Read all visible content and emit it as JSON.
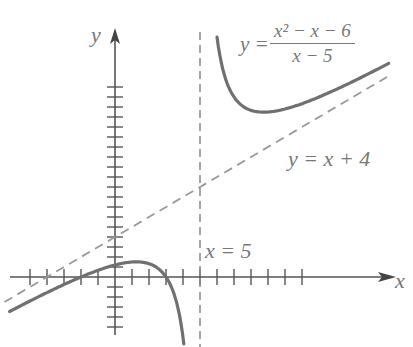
{
  "chart_data": {
    "type": "line",
    "title": "",
    "xlabel": "x",
    "ylabel": "y",
    "series": [
      {
        "name": "y = (x^2 - x - 6)/(x - 5)",
        "style": "solid",
        "color": "#707070",
        "branches": [
          {
            "x": [
              -7.5,
              -6,
              -4,
              -2,
              0,
              1,
              2,
              3,
              3.5,
              4,
              4.3
            ],
            "y": [
              -1.2,
              -0.5,
              0.7,
              0.0,
              1.2,
              1.0,
              0.0,
              0.0,
              -1.7,
              -6,
              -10
            ]
          },
          {
            "x": [
              6.1,
              6.5,
              7,
              8,
              9,
              10,
              11.5,
              13,
              16
            ],
            "y": [
              24.5,
              20,
              18,
              18.7,
              18.5,
              19.1,
              20.5,
              21.4,
              23.9
            ]
          }
        ]
      },
      {
        "name": "y = x + 4",
        "style": "dashed",
        "color": "#909090",
        "x": [
          -7.5,
          16
        ],
        "y": [
          -3.5,
          20
        ]
      },
      {
        "name": "x = 5",
        "style": "dashed",
        "color": "#808080",
        "x": [
          5,
          5
        ],
        "y": [
          -10,
          24
        ]
      }
    ],
    "annotations": [
      "y = (x^2 - x - 6)/(x - 5)",
      "y = x + 4",
      "x = 5"
    ],
    "x_ticks_count": 16,
    "y_ticks_count": 20,
    "grid": false,
    "legend": "none (inline labels)"
  },
  "labels": {
    "y_axis": "y",
    "x_axis": "x",
    "func_lhs": "y =",
    "func_num": "x² − x − 6",
    "func_den": "x − 5",
    "asymptote_oblique": "y = x + 4",
    "asymptote_vertical": "x = 5"
  }
}
